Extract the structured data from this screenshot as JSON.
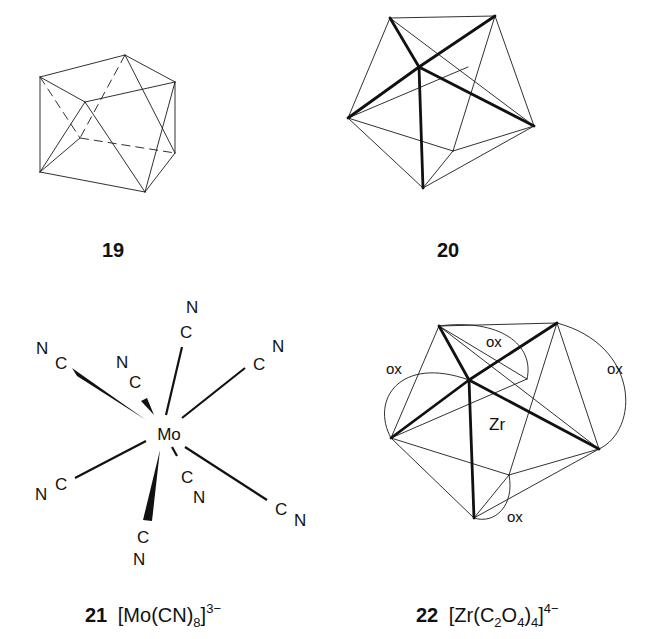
{
  "figures": [
    {
      "id": "19",
      "label": "19",
      "description": "square antiprism (wireframe)"
    },
    {
      "id": "20",
      "label": "20",
      "description": "dodecahedron (wireframe, bold front edges)"
    },
    {
      "id": "21",
      "label": "21",
      "formula": {
        "open": "[Mo(CN)",
        "subscript": "8",
        "close": "]",
        "superscript": "3−"
      },
      "central_atom": "Mo",
      "ligands": [
        {
          "c": "C",
          "n": "N",
          "position": "upper-left"
        },
        {
          "c": "C",
          "n": "N",
          "position": "upper-left-inner"
        },
        {
          "c": "C",
          "n": "N",
          "position": "top"
        },
        {
          "c": "C",
          "n": "N",
          "position": "upper-right"
        },
        {
          "c": "C",
          "n": "N",
          "position": "lower-left"
        },
        {
          "c": "C",
          "n": "N",
          "position": "bottom"
        },
        {
          "c": "C",
          "n": "N",
          "position": "lower-center"
        },
        {
          "c": "C",
          "n": "N",
          "position": "lower-right"
        }
      ]
    },
    {
      "id": "22",
      "label": "22",
      "formula": {
        "open": "[Zr(C",
        "sub1": "2",
        "mid": "O",
        "sub2": "4",
        "close_paren": ")",
        "sub3": "4",
        "close": "]",
        "superscript": "4−"
      },
      "central_atom": "Zr",
      "chelate_labels": [
        "ox",
        "ox",
        "ox",
        "ox"
      ]
    }
  ]
}
